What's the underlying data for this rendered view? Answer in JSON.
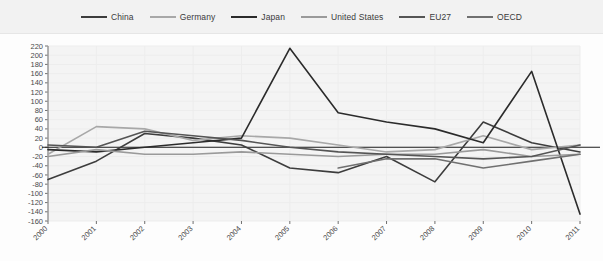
{
  "legend": {
    "position": "top",
    "items": [
      {
        "label": "China",
        "color": "#3d3d3d"
      },
      {
        "label": "Germany",
        "color": "#a8a8a8"
      },
      {
        "label": "Japan",
        "color": "#2b2b2b"
      },
      {
        "label": "United States",
        "color": "#9a9a9a"
      },
      {
        "label": "EU27",
        "color": "#555555"
      },
      {
        "label": "OECD",
        "color": "#707070"
      }
    ]
  },
  "chart_data": {
    "type": "line",
    "title": "",
    "subtitle": "",
    "xlabel": "",
    "ylabel": "",
    "grid": true,
    "legend_position": "top",
    "categories": [
      "2000",
      "2001",
      "2002",
      "2003",
      "2004",
      "2005",
      "2006",
      "2007",
      "2008",
      "2009",
      "2010",
      "2011"
    ],
    "x": [
      2000,
      2001,
      2002,
      2003,
      2004,
      2005,
      2006,
      2007,
      2008,
      2009,
      2010,
      2011
    ],
    "ylim": [
      -160,
      220
    ],
    "ytick_step": 20,
    "yticks": [
      220,
      200,
      180,
      160,
      140,
      120,
      100,
      80,
      60,
      40,
      20,
      0,
      -20,
      -40,
      -60,
      -80,
      -100,
      -120,
      -140,
      -160
    ],
    "series": [
      {
        "name": "China",
        "color": "#3d3d3d",
        "values": [
          -70,
          -30,
          30,
          20,
          5,
          -45,
          -55,
          -20,
          -75,
          55,
          10,
          -10
        ]
      },
      {
        "name": "Germany",
        "color": "#a8a8a8",
        "values": [
          -15,
          45,
          40,
          15,
          25,
          20,
          5,
          -10,
          -5,
          25,
          -5,
          5
        ]
      },
      {
        "name": "Japan",
        "color": "#2b2b2b",
        "values": [
          -5,
          -10,
          0,
          10,
          20,
          215,
          75,
          55,
          40,
          10,
          165,
          -145
        ]
      },
      {
        "name": "United States",
        "color": "#9a9a9a",
        "values": [
          -20,
          -5,
          -15,
          -15,
          -10,
          -15,
          -20,
          -15,
          -15,
          -5,
          -20,
          -15
        ]
      },
      {
        "name": "EU27",
        "color": "#555555",
        "values": [
          5,
          0,
          35,
          25,
          15,
          0,
          -10,
          -15,
          -20,
          -25,
          -20,
          5
        ]
      },
      {
        "name": "OECD",
        "color": "#707070",
        "values": [
          null,
          null,
          null,
          null,
          null,
          null,
          -45,
          -25,
          -25,
          -45,
          -30,
          -15
        ]
      }
    ]
  }
}
